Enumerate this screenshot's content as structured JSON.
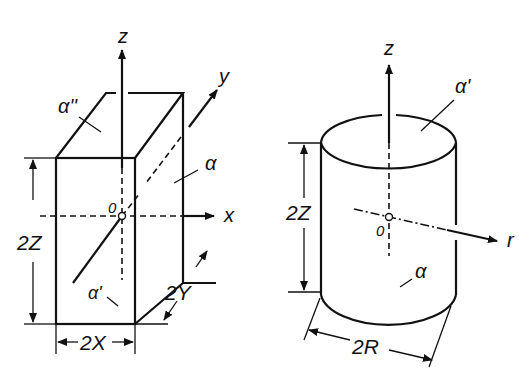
{
  "figure": {
    "left": {
      "title": "rectangular-prism",
      "axes": {
        "z": "z",
        "y": "y",
        "x": "x"
      },
      "origin": "0",
      "faces": {
        "side": "α",
        "top": "α''",
        "front": "α'"
      },
      "dimensions": {
        "height": "2Z",
        "width": "2X",
        "depth": "2Y"
      }
    },
    "right": {
      "title": "cylinder",
      "axes": {
        "z": "z",
        "r": "r"
      },
      "origin": "0",
      "faces": {
        "top": "α'",
        "side": "α"
      },
      "dimensions": {
        "height": "2Z",
        "diameter": "2R"
      }
    }
  }
}
